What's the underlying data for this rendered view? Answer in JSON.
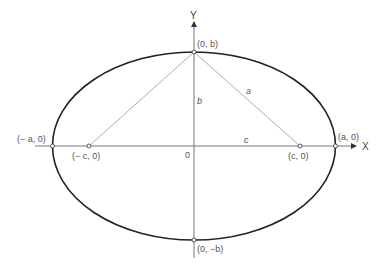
{
  "diagram": {
    "type": "ellipse-with-foci",
    "colors": {
      "ellipse": "#222222",
      "axes": "#777777",
      "construction_lines": "#999999",
      "text": "#555555"
    },
    "axes": {
      "x_label": "X",
      "y_label": "Y",
      "origin_label": "0"
    },
    "points": {
      "top": "(0, b)",
      "bottom": "(0, −b)",
      "left_vertex": "(− a, 0)",
      "right_vertex": "(a, 0)",
      "left_focus": "(− c, 0)",
      "right_focus": "(c, 0)"
    },
    "segments": {
      "semi_minor": "b",
      "hypotenuse": "a",
      "focal_distance": "c"
    }
  }
}
